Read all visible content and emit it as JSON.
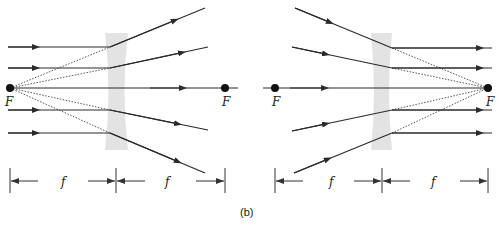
{
  "figure": {
    "caption": "(b)",
    "left_diagram": {
      "description": "Diverging lens: parallel rays diverge appearing to come from front focal point",
      "focal_labels": [
        "F",
        "F"
      ],
      "dimension_labels": [
        "f",
        "f"
      ],
      "lens_color": "#e3e3e3"
    },
    "right_diagram": {
      "description": "Diverging lens: rays converging toward back focal point emerge parallel",
      "focal_labels": [
        "F",
        "F"
      ],
      "dimension_labels": [
        "f",
        "f"
      ],
      "lens_color": "#e3e3e3"
    }
  }
}
